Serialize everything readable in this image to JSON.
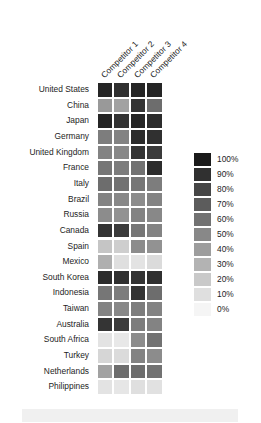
{
  "chart_data": {
    "type": "heatmap",
    "title": "",
    "subtitle": "",
    "xlabel": "",
    "ylabel": "",
    "grid": false,
    "legend_position": "right",
    "colormap": "grayscale-reversed",
    "color_low": "#f5f5f5",
    "color_high": "#1a1a1a",
    "value_unit": "%",
    "zlim": [
      0,
      100
    ],
    "categories_x": [
      "Competitor 1",
      "Competitor 2",
      "Competitor 3",
      "Competitor 4"
    ],
    "categories_y": [
      "United States",
      "China",
      "Japan",
      "Germany",
      "United Kingdom",
      "France",
      "Italy",
      "Brazil",
      "Russia",
      "Canada",
      "Spain",
      "Mexico",
      "South Korea",
      "Indonesia",
      "Taiwan",
      "Australia",
      "South Africa",
      "Turkey",
      "Netherlands",
      "Philippines"
    ],
    "values": [
      [
        95,
        90,
        95,
        95
      ],
      [
        42,
        38,
        88,
        62
      ],
      [
        95,
        88,
        95,
        92
      ],
      [
        55,
        52,
        92,
        90
      ],
      [
        52,
        50,
        88,
        85
      ],
      [
        58,
        55,
        60,
        92
      ],
      [
        62,
        60,
        58,
        55
      ],
      [
        52,
        50,
        48,
        52
      ],
      [
        48,
        45,
        52,
        50
      ],
      [
        88,
        85,
        58,
        52
      ],
      [
        22,
        18,
        48,
        45
      ],
      [
        32,
        10,
        8,
        12
      ],
      [
        92,
        90,
        88,
        90
      ],
      [
        58,
        55,
        88,
        62
      ],
      [
        52,
        50,
        55,
        52
      ],
      [
        88,
        85,
        55,
        52
      ],
      [
        8,
        6,
        48,
        60
      ],
      [
        14,
        12,
        52,
        48
      ],
      [
        38,
        62,
        62,
        60
      ],
      [
        8,
        7,
        10,
        9
      ]
    ],
    "legend_ticks": [
      {
        "label": "100%",
        "value": 100
      },
      {
        "label": "90%",
        "value": 90
      },
      {
        "label": "80%",
        "value": 80
      },
      {
        "label": "70%",
        "value": 70
      },
      {
        "label": "60%",
        "value": 60
      },
      {
        "label": "50%",
        "value": 50
      },
      {
        "label": "40%",
        "value": 40
      },
      {
        "label": "30%",
        "value": 30
      },
      {
        "label": "20%",
        "value": 20
      },
      {
        "label": "10%",
        "value": 10
      },
      {
        "label": "0%",
        "value": 0
      }
    ]
  }
}
